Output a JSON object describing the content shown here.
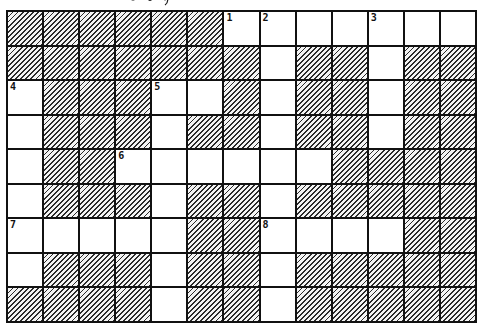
{
  "puzzle": {
    "type": "crossword-grid",
    "rows": 9,
    "cols": 13,
    "colors": {
      "line": "#111111",
      "blocked_hatch": "#2a2a2a",
      "open": "#ffffff"
    },
    "grid": [
      [
        1,
        1,
        1,
        1,
        1,
        1,
        0,
        0,
        0,
        0,
        0,
        0,
        0
      ],
      [
        1,
        1,
        1,
        1,
        1,
        1,
        1,
        0,
        1,
        1,
        0,
        1,
        1
      ],
      [
        0,
        1,
        1,
        1,
        0,
        0,
        1,
        0,
        1,
        1,
        0,
        1,
        1
      ],
      [
        0,
        1,
        1,
        1,
        0,
        1,
        1,
        0,
        1,
        1,
        0,
        1,
        1
      ],
      [
        0,
        1,
        1,
        0,
        0,
        0,
        0,
        0,
        0,
        1,
        1,
        1,
        1
      ],
      [
        0,
        1,
        1,
        1,
        0,
        1,
        1,
        0,
        1,
        1,
        1,
        1,
        1
      ],
      [
        0,
        0,
        0,
        0,
        0,
        1,
        1,
        0,
        0,
        0,
        0,
        1,
        1
      ],
      [
        0,
        1,
        1,
        1,
        0,
        1,
        1,
        0,
        1,
        1,
        1,
        1,
        1
      ],
      [
        1,
        1,
        1,
        1,
        0,
        1,
        1,
        0,
        1,
        1,
        1,
        1,
        1
      ]
    ],
    "numbers": [
      {
        "row": 0,
        "col": 6,
        "label": "1"
      },
      {
        "row": 0,
        "col": 7,
        "label": "2"
      },
      {
        "row": 0,
        "col": 10,
        "label": "3"
      },
      {
        "row": 2,
        "col": 0,
        "label": "4"
      },
      {
        "row": 2,
        "col": 4,
        "label": "5"
      },
      {
        "row": 4,
        "col": 3,
        "label": "6"
      },
      {
        "row": 6,
        "col": 0,
        "label": "7"
      },
      {
        "row": 6,
        "col": 7,
        "label": "8"
      }
    ]
  }
}
